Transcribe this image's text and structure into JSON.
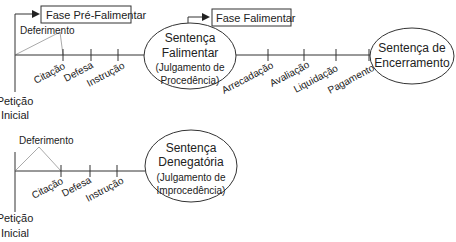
{
  "diagram1": {
    "phase_pre": "Fase Pré-Falimentar",
    "phase_fal": "Fase Falimentar",
    "deferimento": "Deferimento",
    "peticao": [
      "Petição",
      "Inicial"
    ],
    "steps_pre": [
      "Citação",
      "Defesa",
      "Instrução"
    ],
    "sentenca_falimentar": [
      "Sentença",
      "Falimentar",
      "(Julgamento de",
      "Procedência)"
    ],
    "steps_fal": [
      "Arrecadação",
      "Avaliação",
      "Liquidação",
      "Pagamento"
    ],
    "sentenca_encerramento": [
      "Sentença de",
      "Encerramento"
    ]
  },
  "diagram2": {
    "deferimento": "Deferimento",
    "peticao": [
      "Petição",
      "Inicial"
    ],
    "steps": [
      "Citação",
      "Defesa",
      "Instrução"
    ],
    "sentenca_denegatoria": [
      "Sentença",
      "Denegatória",
      "(Julgamento de",
      "Improcedência)"
    ]
  },
  "colors": {
    "line": "#333333",
    "thin": "#999999"
  }
}
